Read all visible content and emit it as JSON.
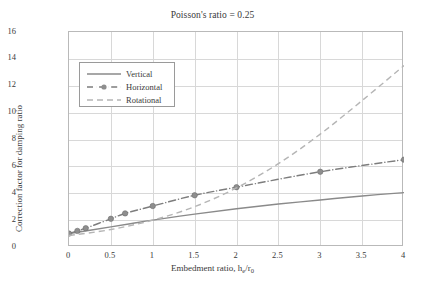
{
  "chart_data": {
    "type": "line",
    "title": "Poisson's ratio = 0.25",
    "xlabel_prefix": "Embedment ratio, h",
    "xlabel_sub1": "e",
    "xlabel_mid": "/r",
    "xlabel_sub2": "0",
    "xlabel": "Embedment ratio, he/r0",
    "ylabel": "Correction factor for damping ratio",
    "xlim": [
      0,
      4
    ],
    "ylim": [
      0,
      16
    ],
    "xticks": [
      "0",
      "0.5",
      "1",
      "1.5",
      "2",
      "2.5",
      "3",
      "3.5",
      "4"
    ],
    "xtick_values": [
      0,
      0.5,
      1,
      1.5,
      2,
      2.5,
      3,
      3.5,
      4
    ],
    "yticks": [
      "0",
      "2",
      "4",
      "6",
      "8",
      "10",
      "12",
      "14",
      "16"
    ],
    "ytick_values": [
      0,
      2,
      4,
      6,
      8,
      10,
      12,
      14,
      16
    ],
    "grid": true,
    "legend_position": "upper left inside",
    "series": [
      {
        "name": "Vertical",
        "style": "solid",
        "color": "#8a8a8a",
        "markers": false,
        "x": [
          0,
          0.25,
          0.5,
          0.75,
          1,
          1.5,
          2,
          2.5,
          3,
          3.5,
          4
        ],
        "y": [
          1.0,
          1.25,
          1.5,
          1.75,
          2.0,
          2.45,
          2.85,
          3.2,
          3.5,
          3.8,
          4.05
        ]
      },
      {
        "name": "Horizontal",
        "style": "dash-dot",
        "color": "#7d7d7d",
        "markers": true,
        "x": [
          0,
          0.1,
          0.2,
          0.5,
          0.67,
          1,
          1.5,
          2,
          3,
          4
        ],
        "y": [
          1.0,
          1.2,
          1.4,
          2.1,
          2.5,
          3.05,
          3.85,
          4.45,
          5.6,
          6.5
        ]
      },
      {
        "name": "Rotational",
        "style": "dashed",
        "color": "#b5b5b5",
        "markers": false,
        "x": [
          0,
          0.5,
          1,
          1.5,
          2,
          2.5,
          3,
          3.5,
          4
        ],
        "y": [
          0.85,
          1.3,
          2.0,
          3.0,
          4.4,
          6.2,
          8.4,
          10.9,
          13.5
        ]
      }
    ]
  },
  "legend": {
    "items": [
      {
        "label": "Vertical"
      },
      {
        "label": "Horizontal"
      },
      {
        "label": "Rotational"
      }
    ]
  },
  "colors": {
    "grid": "#d8d8d8",
    "frame": "#b9b9b9",
    "text": "#3a3a3a",
    "vertical": "#8a8a8a",
    "horizontal": "#7d7d7d",
    "rotational": "#b5b5b5"
  }
}
